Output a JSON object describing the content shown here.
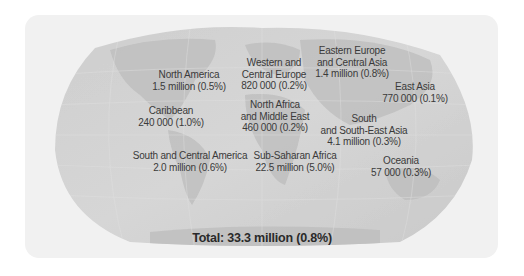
{
  "map": {
    "colors": {
      "card_background": "#f1f1f1",
      "ocean": "#d2d2d2",
      "land": "#bdbdbd",
      "text": "#3a3a3a"
    },
    "regions": [
      {
        "id": "north-america",
        "name": "North America",
        "value": "1.5 million (0.5%)"
      },
      {
        "id": "caribbean",
        "name": "Caribbean",
        "value": "240 000 (1.0%)"
      },
      {
        "id": "western-central-europe",
        "name": "Western and",
        "name2": "Central Europe",
        "value": "820 000 (0.2%)"
      },
      {
        "id": "eastern-europe-central-asia",
        "name": "Eastern Europe",
        "name2": "and Central Asia",
        "value": "1.4 million (0.8%)"
      },
      {
        "id": "east-asia",
        "name": "East Asia",
        "value": "770 000 (0.1%)"
      },
      {
        "id": "north-africa-middle-east",
        "name": "North Africa",
        "name2": "and Middle East",
        "value": "460 000 (0.2%)"
      },
      {
        "id": "south-southeast-asia",
        "name": "South",
        "name2": "and South-East Asia",
        "value": "4.1 million (0.3%)"
      },
      {
        "id": "south-central-america",
        "name": "South and Central America",
        "value": "2.0 million (0.6%)"
      },
      {
        "id": "sub-saharan-africa",
        "name": "Sub-Saharan Africa",
        "value": "22.5 million (5.0%)"
      },
      {
        "id": "oceania",
        "name": "Oceania",
        "value": "57 000 (0.3%)"
      }
    ],
    "total": "Total: 33.3 million (0.8%)"
  }
}
